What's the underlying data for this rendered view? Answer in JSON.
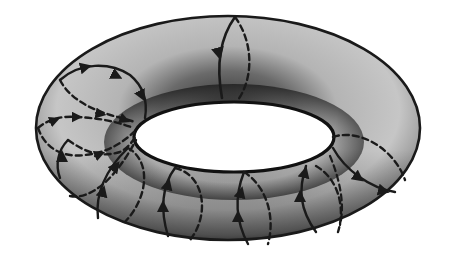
{
  "figure": {
    "type": "torus-diagram",
    "colors": {
      "background": "#ffffff",
      "surface_light": "#c8c8c8",
      "surface_mid": "#9a9a9a",
      "surface_dark": "#3a3a3a",
      "outline": "#1a1a1a",
      "loop_stroke": "#1a1a1a",
      "hole_fill": "#ffffff"
    },
    "torus": {
      "outer": {
        "cx": 228,
        "cy": 128,
        "rx": 192,
        "ry": 112
      },
      "hole": {
        "cx": 234,
        "cy": 137,
        "rx": 100,
        "ry": 35
      }
    },
    "loops": [
      {
        "id": "top",
        "label": "meridian-top"
      },
      {
        "id": "left-upper",
        "label": "meridian-left-upper"
      },
      {
        "id": "left-mid",
        "label": "meridian-left-mid"
      },
      {
        "id": "left-lower",
        "label": "meridian-left-lower"
      },
      {
        "id": "bottom-left",
        "label": "meridian-bottom-left"
      },
      {
        "id": "bottom-center-left",
        "label": "meridian-bottom-center-left"
      },
      {
        "id": "bottom-center",
        "label": "meridian-bottom-center"
      },
      {
        "id": "bottom-right",
        "label": "meridian-bottom-right"
      },
      {
        "id": "right",
        "label": "meridian-right"
      }
    ]
  }
}
